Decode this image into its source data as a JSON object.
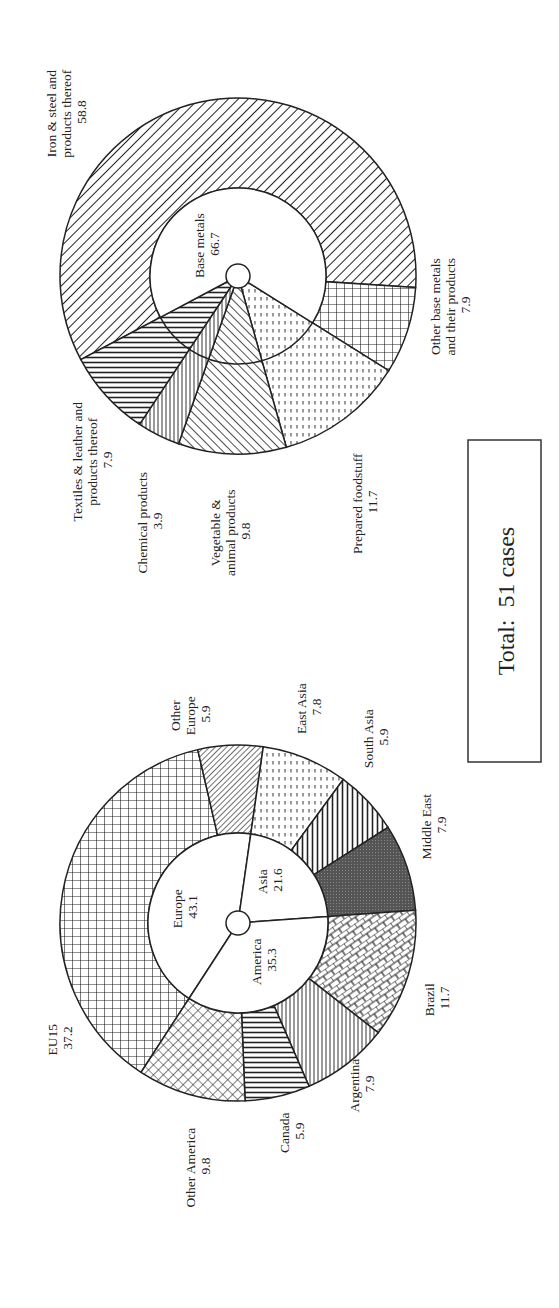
{
  "chart_data": [
    {
      "type": "pie",
      "title": "Cases by region (%)",
      "subtype": "nested-donut",
      "inner_ring": [
        {
          "label": "Europe",
          "value": 43.1
        },
        {
          "label": "Asia",
          "value": 21.6
        },
        {
          "label": "America",
          "value": 35.3
        }
      ],
      "outer_ring": [
        {
          "label": "EU15",
          "value": 37.2,
          "group": "Europe"
        },
        {
          "label": "Other Europe",
          "value": 5.9,
          "group": "Europe"
        },
        {
          "label": "East Asia",
          "value": 7.8,
          "group": "Asia"
        },
        {
          "label": "South Asia",
          "value": 5.9,
          "group": "Asia"
        },
        {
          "label": "Middle East",
          "value": 7.9,
          "group": "Asia"
        },
        {
          "label": "Brazil",
          "value": 11.7,
          "group": "America"
        },
        {
          "label": "Argentina",
          "value": 7.9,
          "group": "America"
        },
        {
          "label": "Canada",
          "value": 5.9,
          "group": "America"
        },
        {
          "label": "Other America",
          "value": 9.8,
          "group": "America"
        }
      ]
    },
    {
      "type": "pie",
      "title": "Cases by product (%)",
      "subtype": "nested-donut",
      "inner_ring": [
        {
          "label": "Base metals",
          "value": 66.7
        }
      ],
      "outer_ring": [
        {
          "label": "Iron & steel and products thereof",
          "value": 58.8,
          "group": "Base metals"
        },
        {
          "label": "Other base metals and their products",
          "value": 7.9,
          "group": "Base metals"
        },
        {
          "label": "Prepared foodstuff",
          "value": 11.7
        },
        {
          "label": "Vegetable & animal products",
          "value": 9.8
        },
        {
          "label": "Chemical products",
          "value": 3.9
        },
        {
          "label": "Textiles & leather and products thereof",
          "value": 7.9
        }
      ]
    }
  ],
  "total": {
    "text": "Total:  51 cases",
    "count": 51
  },
  "products_chart": {
    "inner": {
      "base_metals": {
        "name": "Base metals",
        "value": "66.7"
      }
    },
    "labels": {
      "iron": {
        "l1": "Iron & steel and",
        "l2": "products thereof",
        "v": "58.8"
      },
      "other_base": {
        "l1": "Other base metals",
        "l2": "and their products",
        "v": "7.9"
      },
      "prepared": {
        "l1": "Prepared foodstuff",
        "v": "11.7"
      },
      "vegetable": {
        "l1": "Vegetable &",
        "l2": "animal products",
        "v": "9.8"
      },
      "chemical": {
        "l1": "Chemical products",
        "v": "3.9"
      },
      "textiles": {
        "l1": "Textiles & leather and",
        "l2": "products thereof",
        "v": "7.9"
      }
    }
  },
  "regions_chart": {
    "inner": {
      "europe": {
        "name": "Europe",
        "value": "43.1"
      },
      "asia": {
        "name": "Asia",
        "value": "21.6"
      },
      "america": {
        "name": "America",
        "value": "35.3"
      }
    },
    "labels": {
      "eu15": {
        "l1": "EU15",
        "v": "37.2"
      },
      "other_europe": {
        "l1": "Other",
        "l2": "Europe",
        "v": "5.9"
      },
      "east_asia": {
        "l1": "East Asia",
        "v": "7.8"
      },
      "south_asia": {
        "l1": "South Asia",
        "v": "5.9"
      },
      "middle_east": {
        "l1": "Middle East",
        "v": "7.9"
      },
      "brazil": {
        "l1": "Brazil",
        "v": "11.7"
      },
      "argentina": {
        "l1": "Argentina",
        "v": "7.9"
      },
      "canada": {
        "l1": "Canada",
        "v": "5.9"
      },
      "other_america": {
        "l1": "Other America",
        "v": "9.8"
      }
    }
  }
}
